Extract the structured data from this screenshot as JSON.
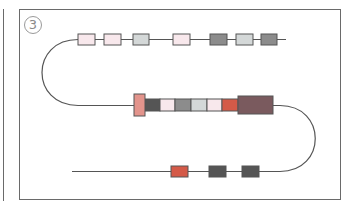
{
  "panel": {
    "label": "3"
  },
  "colors": {
    "line": "#555555",
    "border": "#6a6a6a",
    "pale_pink": "#f8e8ec",
    "light_gray": "#d4d8d8",
    "mid_gray": "#8c8c8c",
    "dark_gray": "#555555",
    "salmon": "#e3948c",
    "red": "#d45a48",
    "maroon": "#7a5a5e"
  },
  "rows": [
    {
      "name": "top-strand",
      "boxes": [
        {
          "x": 78,
          "w": 17,
          "color": "pale_pink"
        },
        {
          "x": 104,
          "w": 17,
          "color": "pale_pink"
        },
        {
          "x": 133,
          "w": 16,
          "color": "light_gray"
        },
        {
          "x": 173,
          "w": 17,
          "color": "pale_pink"
        },
        {
          "x": 210,
          "w": 17,
          "color": "mid_gray"
        },
        {
          "x": 236,
          "w": 17,
          "color": "light_gray"
        },
        {
          "x": 261,
          "w": 16,
          "color": "mid_gray"
        }
      ]
    },
    {
      "name": "middle-strand",
      "boxes": [
        {
          "x": 145,
          "w": 15,
          "color": "dark_gray"
        },
        {
          "x": 160,
          "w": 15,
          "color": "pale_pink"
        },
        {
          "x": 175,
          "w": 16,
          "color": "mid_gray"
        },
        {
          "x": 191,
          "w": 16,
          "color": "light_gray"
        },
        {
          "x": 207,
          "w": 15,
          "color": "pale_pink"
        },
        {
          "x": 222,
          "w": 16,
          "color": "red"
        }
      ]
    },
    {
      "name": "bottom-strand",
      "boxes": [
        {
          "x": 171,
          "w": 17,
          "color": "red"
        },
        {
          "x": 209,
          "w": 17,
          "color": "dark_gray"
        },
        {
          "x": 242,
          "w": 17,
          "color": "dark_gray"
        }
      ]
    }
  ]
}
